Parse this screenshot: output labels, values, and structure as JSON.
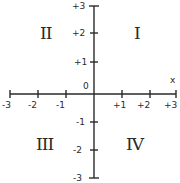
{
  "diagram": {
    "title": "",
    "x_axis_label": "x",
    "origin_label": "0",
    "x_ticks": [
      "-3",
      "-2",
      "-1",
      "+1",
      "+2",
      "+3"
    ],
    "y_ticks": [
      "+3",
      "+2",
      "+1",
      "-1",
      "-2",
      "-3"
    ],
    "quadrants": {
      "I": "I",
      "II": "II",
      "III": "III",
      "IV": "IV"
    },
    "colors": {
      "ink": "#2a2a2a",
      "background": "#ffffff"
    }
  }
}
